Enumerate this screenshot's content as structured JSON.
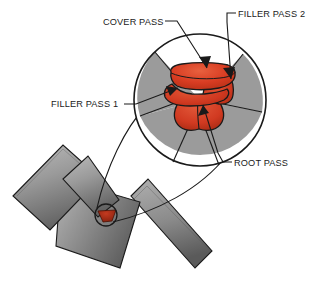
{
  "figure": {
    "background_color": "#ffffff"
  },
  "colors": {
    "weld_bead": "#d83c22",
    "weld_bead_dark": "#a32a13",
    "weld_bead_light": "#e8613f",
    "plate_gray_light": "#b4b4b4",
    "plate_gray_mid": "#8f8f8f",
    "plate_gray_dark": "#6b6b6b",
    "magnifier_gray": "#9b9b9b",
    "outline": "#1a1a1a",
    "text": "#1a1a1a"
  },
  "labels": [
    {
      "id": "cover-pass",
      "text": "COVER PASS",
      "text_x": 103,
      "text_y": 25,
      "anchor": "start",
      "leader": "M 165 21 L 177 21 L 207 68",
      "arrow": "M 207 68 L 200 58 L 211 57 Z"
    },
    {
      "id": "filler-pass-2",
      "text": "FILLER PASS 2",
      "text_x": 238,
      "text_y": 17,
      "anchor": "start",
      "leader": "M 236 13 L 227 13 L 227 21 L 231 79",
      "arrow": "M 231 79 L 224 69 L 235 68 Z"
    },
    {
      "id": "filler-pass-1",
      "text": "FILLER PASS 1",
      "text_x": 51,
      "text_y": 107,
      "anchor": "start",
      "leader": "M 124 104 L 136 104 L 178 88",
      "arrow": "M 178 88 L 167 87 L 171 96 Z"
    },
    {
      "id": "root-pass",
      "text": "ROOT PASS",
      "text_x": 234,
      "text_y": 166,
      "anchor": "start",
      "leader": "M 232 162 L 223 162 L 219 154 L 203 104",
      "arrow": "M 203 104 L 199 115 L 209 112 Z"
    }
  ],
  "magnifier": {
    "center_x": 200,
    "center_y": 100,
    "radius": 66,
    "stroke_width": 1.6,
    "description": "Magnified weld cross-section showing four stacked passes"
  },
  "detail_circle": {
    "center_x": 106,
    "center_y": 215,
    "radius": 11,
    "stroke_width": 1.3,
    "description": "Small callout circle at the weld root on the T-joint"
  },
  "weld_passes": [
    {
      "id": "root-pass-bead",
      "name": "Root pass",
      "order": 1,
      "position": "bottom of groove"
    },
    {
      "id": "filler-pass-1-bead",
      "name": "Filler pass 1",
      "order": 2,
      "position": "lower-left over root"
    },
    {
      "id": "filler-pass-2-bead",
      "name": "Filler pass 2",
      "order": 3,
      "position": "right side of groove"
    },
    {
      "id": "cover-pass-bead",
      "name": "Cover pass",
      "order": 4,
      "position": "top cap of weld"
    }
  ],
  "plates": [
    {
      "id": "vertical-plate",
      "name": "Upright plate"
    },
    {
      "id": "horizontal-plate",
      "name": "Base plate"
    },
    {
      "id": "angled-plate",
      "name": "Angled plate"
    }
  ]
}
